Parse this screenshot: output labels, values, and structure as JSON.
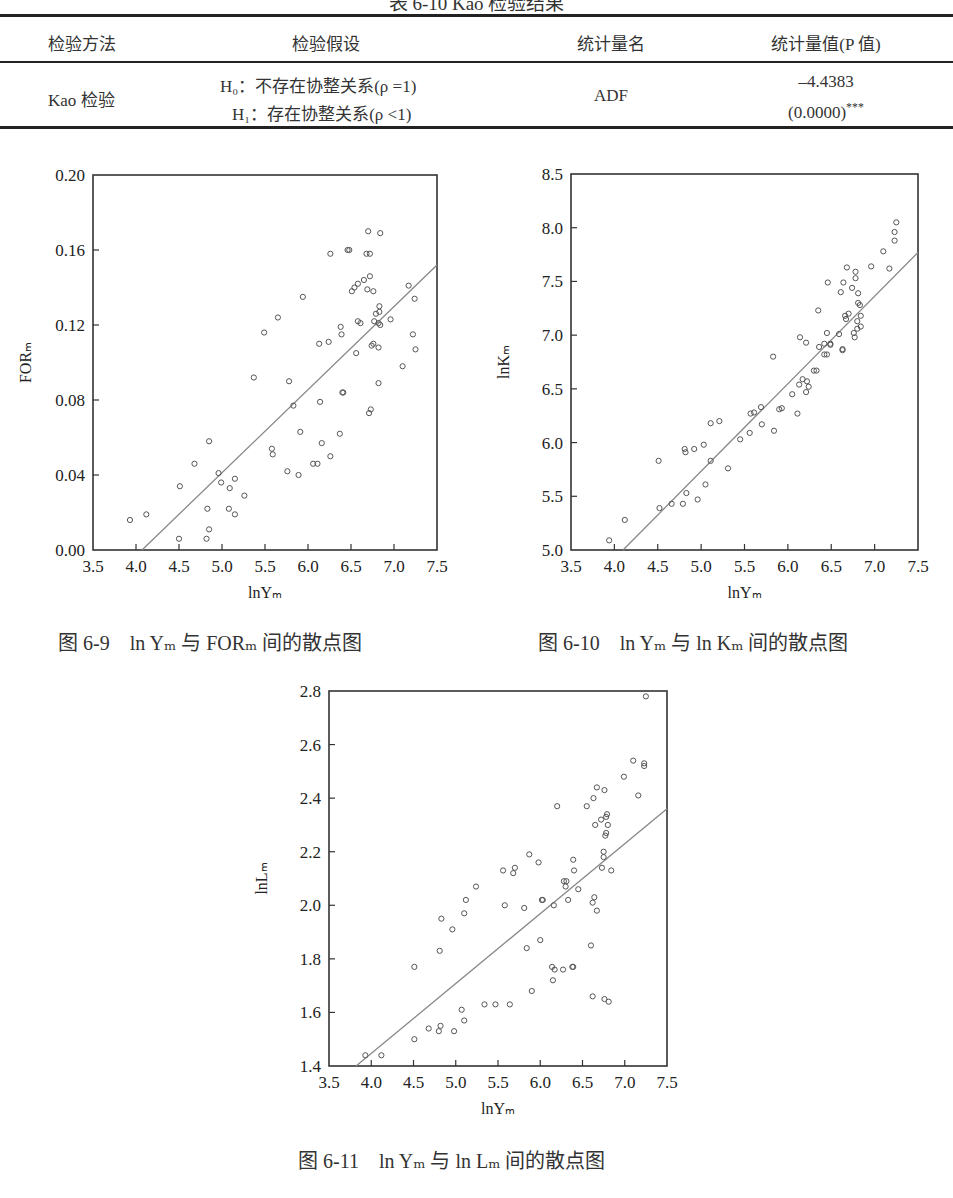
{
  "page": {
    "table_caption": "表 6-10 Kao 检验结果",
    "table": {
      "headers": [
        "检验方法",
        "检验假设",
        "统计量名",
        "统计量值(P 值)"
      ],
      "rows": [
        {
          "method": "Kao 检验",
          "hypothesis_h0": "H₀：不存在协整关系(ρ =1)",
          "hypothesis_h1": "H₁：存在协整关系(ρ <1)",
          "statistic_name": "ADF",
          "statistic_value": "–4.4383",
          "p_value": "(0.0000)",
          "significance": "***"
        }
      ]
    }
  },
  "chart_data": [
    {
      "id": "fig-6-9",
      "type": "scatter",
      "title": "图 6-9　ln Yₘ 与 FORₘ 间的散点图",
      "caption_parts": {
        "prefix": "图 6-9",
        "text": "ln Yₘ 与 FORₘ 间的散点图"
      },
      "xlabel": "lnYₘ",
      "ylabel": "FORₘ",
      "xlim": [
        3.5,
        7.5
      ],
      "ylim": [
        0.0,
        0.2
      ],
      "xticks": [
        "3.5",
        "4.0",
        "4.5",
        "5.0",
        "5.5",
        "6.0",
        "6.5",
        "7.0",
        "7.5"
      ],
      "yticks": [
        "0.00",
        "0.04",
        "0.08",
        "0.12",
        "0.16",
        "0.20"
      ],
      "grid": false,
      "legend": "none",
      "fit_line": {
        "x": [
          4.07,
          7.5
        ],
        "y": [
          0.0,
          0.152
        ]
      },
      "points": [
        [
          3.93,
          0.016
        ],
        [
          4.12,
          0.019
        ],
        [
          4.51,
          0.034
        ],
        [
          4.68,
          0.046
        ],
        [
          4.5,
          0.006
        ],
        [
          4.82,
          0.006
        ],
        [
          4.83,
          0.022
        ],
        [
          4.85,
          0.011
        ],
        [
          4.85,
          0.058
        ],
        [
          4.96,
          0.041
        ],
        [
          4.99,
          0.036
        ],
        [
          5.08,
          0.022
        ],
        [
          5.09,
          0.033
        ],
        [
          5.15,
          0.038
        ],
        [
          5.15,
          0.019
        ],
        [
          5.26,
          0.029
        ],
        [
          5.37,
          0.092
        ],
        [
          5.58,
          0.054
        ],
        [
          5.59,
          0.051
        ],
        [
          5.76,
          0.042
        ],
        [
          5.78,
          0.09
        ],
        [
          5.83,
          0.077
        ],
        [
          5.89,
          0.04
        ],
        [
          5.91,
          0.063
        ],
        [
          6.06,
          0.046
        ],
        [
          6.11,
          0.046
        ],
        [
          6.14,
          0.079
        ],
        [
          6.16,
          0.057
        ],
        [
          6.26,
          0.05
        ],
        [
          6.37,
          0.062
        ],
        [
          6.4,
          0.084
        ],
        [
          6.41,
          0.084
        ],
        [
          6.56,
          0.105
        ],
        [
          6.71,
          0.073
        ],
        [
          6.73,
          0.075
        ],
        [
          6.74,
          0.109
        ],
        [
          6.76,
          0.11
        ],
        [
          6.82,
          0.089
        ],
        [
          6.82,
          0.108
        ],
        [
          7.1,
          0.098
        ],
        [
          7.25,
          0.107
        ],
        [
          7.22,
          0.115
        ],
        [
          7.24,
          0.134
        ],
        [
          7.17,
          0.141
        ],
        [
          5.49,
          0.116
        ],
        [
          5.65,
          0.124
        ],
        [
          5.94,
          0.135
        ],
        [
          6.13,
          0.11
        ],
        [
          6.24,
          0.111
        ],
        [
          6.26,
          0.158
        ],
        [
          6.38,
          0.119
        ],
        [
          6.39,
          0.115
        ],
        [
          6.46,
          0.16
        ],
        [
          6.48,
          0.16
        ],
        [
          6.51,
          0.138
        ],
        [
          6.54,
          0.14
        ],
        [
          6.58,
          0.122
        ],
        [
          6.58,
          0.142
        ],
        [
          6.61,
          0.121
        ],
        [
          6.65,
          0.144
        ],
        [
          6.68,
          0.158
        ],
        [
          6.69,
          0.139
        ],
        [
          6.7,
          0.17
        ],
        [
          6.72,
          0.158
        ],
        [
          6.72,
          0.146
        ],
        [
          6.76,
          0.138
        ],
        [
          6.77,
          0.122
        ],
        [
          6.79,
          0.126
        ],
        [
          6.83,
          0.13
        ],
        [
          6.83,
          0.127
        ],
        [
          6.82,
          0.121
        ],
        [
          6.84,
          0.12
        ],
        [
          6.84,
          0.169
        ],
        [
          6.96,
          0.123
        ]
      ]
    },
    {
      "id": "fig-6-10",
      "type": "scatter",
      "title": "图 6-10　ln Yₘ 与 ln Kₘ 间的散点图",
      "caption_parts": {
        "prefix": "图 6-10",
        "text": "ln Yₘ 与 ln Kₘ 间的散点图"
      },
      "xlabel": "lnYₘ",
      "ylabel": "lnKₘ",
      "xlim": [
        3.5,
        7.5
      ],
      "ylim": [
        5.0,
        8.5
      ],
      "xticks": [
        "3.5",
        "4.0",
        "4.5",
        "5.0",
        "5.5",
        "6.0",
        "6.5",
        "7.0",
        "7.5"
      ],
      "yticks": [
        "5.0",
        "5.5",
        "6.0",
        "6.5",
        "7.0",
        "7.5",
        "8.0",
        "8.5"
      ],
      "grid": false,
      "legend": "none",
      "fit_line": {
        "x": [
          4.1,
          7.5
        ],
        "y": [
          5.0,
          7.77
        ]
      },
      "points": [
        [
          3.94,
          5.09
        ],
        [
          4.12,
          5.28
        ],
        [
          4.51,
          5.83
        ],
        [
          4.52,
          5.39
        ],
        [
          4.66,
          5.43
        ],
        [
          4.79,
          5.43
        ],
        [
          4.81,
          5.94
        ],
        [
          4.82,
          5.91
        ],
        [
          4.83,
          5.53
        ],
        [
          4.92,
          5.94
        ],
        [
          4.96,
          5.47
        ],
        [
          5.03,
          5.98
        ],
        [
          5.05,
          5.61
        ],
        [
          5.11,
          5.83
        ],
        [
          5.11,
          6.18
        ],
        [
          5.21,
          6.2
        ],
        [
          5.31,
          5.76
        ],
        [
          5.45,
          6.03
        ],
        [
          5.56,
          6.09
        ],
        [
          5.57,
          6.27
        ],
        [
          5.61,
          6.28
        ],
        [
          5.69,
          6.33
        ],
        [
          5.7,
          6.17
        ],
        [
          5.83,
          6.8
        ],
        [
          5.84,
          6.11
        ],
        [
          5.9,
          6.31
        ],
        [
          5.93,
          6.32
        ],
        [
          6.05,
          6.45
        ],
        [
          6.11,
          6.27
        ],
        [
          6.13,
          6.54
        ],
        [
          6.17,
          6.59
        ],
        [
          6.21,
          6.47
        ],
        [
          6.22,
          6.57
        ],
        [
          6.24,
          6.52
        ],
        [
          6.3,
          6.67
        ],
        [
          6.33,
          6.67
        ],
        [
          6.21,
          6.93
        ],
        [
          6.14,
          6.98
        ],
        [
          6.36,
          6.89
        ],
        [
          6.42,
          6.82
        ],
        [
          6.45,
          6.82
        ],
        [
          6.42,
          6.92
        ],
        [
          6.49,
          6.92
        ],
        [
          6.49,
          6.91
        ],
        [
          6.63,
          6.87
        ],
        [
          6.63,
          6.86
        ],
        [
          6.35,
          7.23
        ],
        [
          6.45,
          7.02
        ],
        [
          6.46,
          7.49
        ],
        [
          6.59,
          7.01
        ],
        [
          6.61,
          7.4
        ],
        [
          6.64,
          7.49
        ],
        [
          6.66,
          7.18
        ],
        [
          6.67,
          7.15
        ],
        [
          6.68,
          7.63
        ],
        [
          6.7,
          7.2
        ],
        [
          6.74,
          7.44
        ],
        [
          6.76,
          7.02
        ],
        [
          6.77,
          6.98
        ],
        [
          6.78,
          7.53
        ],
        [
          6.78,
          7.59
        ],
        [
          6.8,
          7.13
        ],
        [
          6.8,
          7.06
        ],
        [
          6.81,
          7.39
        ],
        [
          6.81,
          7.3
        ],
        [
          6.83,
          7.28
        ],
        [
          6.84,
          7.18
        ],
        [
          6.84,
          7.08
        ],
        [
          6.96,
          7.64
        ],
        [
          7.1,
          7.78
        ],
        [
          7.17,
          7.62
        ],
        [
          7.23,
          7.96
        ],
        [
          7.23,
          7.88
        ],
        [
          7.25,
          8.05
        ]
      ]
    },
    {
      "id": "fig-6-11",
      "type": "scatter",
      "title": "图 6-11　ln Yₘ 与 ln Lₘ 间的散点图",
      "caption_parts": {
        "prefix": "图  6-11",
        "text": "ln Yₘ 与 ln Lₘ 间的散点图"
      },
      "xlabel": "lnYₘ",
      "ylabel": "lnLₘ",
      "xlim": [
        3.5,
        7.5
      ],
      "ylim": [
        1.4,
        2.8
      ],
      "xticks": [
        "3.5",
        "4.0",
        "4.5",
        "5.0",
        "5.5",
        "6.0",
        "6.5",
        "7.0",
        "7.5"
      ],
      "yticks": [
        "1.4",
        "1.6",
        "1.8",
        "2.0",
        "2.2",
        "2.4",
        "2.6",
        "2.8"
      ],
      "grid": false,
      "legend": "none",
      "fit_line": {
        "x": [
          3.82,
          7.5
        ],
        "y": [
          1.4,
          2.36
        ]
      },
      "points": [
        [
          3.93,
          1.44
        ],
        [
          4.12,
          1.44
        ],
        [
          4.51,
          1.5
        ],
        [
          4.51,
          1.77
        ],
        [
          4.68,
          1.54
        ],
        [
          4.8,
          1.53
        ],
        [
          4.82,
          1.55
        ],
        [
          4.81,
          1.83
        ],
        [
          4.83,
          1.95
        ],
        [
          4.96,
          1.91
        ],
        [
          4.98,
          1.53
        ],
        [
          5.07,
          1.61
        ],
        [
          5.1,
          1.97
        ],
        [
          5.1,
          1.57
        ],
        [
          5.12,
          2.02
        ],
        [
          5.24,
          2.07
        ],
        [
          5.34,
          1.63
        ],
        [
          5.47,
          1.63
        ],
        [
          5.56,
          2.13
        ],
        [
          5.58,
          2.0
        ],
        [
          5.64,
          1.63
        ],
        [
          5.68,
          2.12
        ],
        [
          5.7,
          2.14
        ],
        [
          5.81,
          1.99
        ],
        [
          5.84,
          1.84
        ],
        [
          5.87,
          2.19
        ],
        [
          5.9,
          1.68
        ],
        [
          5.98,
          2.16
        ],
        [
          6.0,
          1.87
        ],
        [
          6.02,
          2.02
        ],
        [
          6.03,
          2.02
        ],
        [
          6.14,
          1.77
        ],
        [
          6.15,
          1.72
        ],
        [
          6.16,
          2.0
        ],
        [
          6.17,
          1.76
        ],
        [
          6.2,
          2.37
        ],
        [
          6.27,
          1.76
        ],
        [
          6.28,
          2.09
        ],
        [
          6.3,
          2.07
        ],
        [
          6.31,
          2.09
        ],
        [
          6.33,
          2.02
        ],
        [
          6.38,
          1.77
        ],
        [
          6.39,
          1.77
        ],
        [
          6.39,
          2.17
        ],
        [
          6.4,
          2.13
        ],
        [
          6.45,
          2.06
        ],
        [
          6.55,
          2.37
        ],
        [
          6.6,
          1.85
        ],
        [
          6.62,
          1.66
        ],
        [
          6.62,
          2.01
        ],
        [
          6.64,
          2.03
        ],
        [
          6.67,
          1.98
        ],
        [
          6.63,
          2.4
        ],
        [
          6.65,
          2.3
        ],
        [
          6.67,
          2.44
        ],
        [
          6.72,
          2.32
        ],
        [
          6.73,
          2.14
        ],
        [
          6.75,
          2.18
        ],
        [
          6.75,
          2.2
        ],
        [
          6.76,
          1.65
        ],
        [
          6.76,
          2.43
        ],
        [
          6.78,
          2.33
        ],
        [
          6.77,
          2.26
        ],
        [
          6.78,
          2.27
        ],
        [
          6.79,
          2.34
        ],
        [
          6.8,
          2.3
        ],
        [
          6.81,
          1.64
        ],
        [
          6.84,
          2.13
        ],
        [
          6.99,
          2.48
        ],
        [
          7.1,
          2.54
        ],
        [
          7.16,
          2.41
        ],
        [
          7.23,
          2.53
        ],
        [
          7.23,
          2.52
        ],
        [
          7.25,
          2.78
        ]
      ]
    }
  ]
}
